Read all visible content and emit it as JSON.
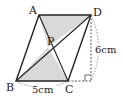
{
  "diagram": {
    "type": "parallelogram-geometry",
    "shape": "parallelogram ABCD with diagonals AC and BD intersecting at P",
    "points": {
      "A": {
        "x": 39,
        "y": 15,
        "label": "A"
      },
      "B": {
        "x": 16,
        "y": 81,
        "label": "B"
      },
      "C": {
        "x": 68,
        "y": 81,
        "label": "C"
      },
      "D": {
        "x": 91,
        "y": 15,
        "label": "D"
      },
      "P": {
        "x": 48,
        "y": 47,
        "label": "P"
      }
    },
    "shaded_regions": [
      "triangle APD",
      "triangle BPC"
    ],
    "dimensions": {
      "base": {
        "label": "5cm",
        "from": "B",
        "to": "C"
      },
      "height": {
        "label": "6cm",
        "from": "D",
        "to": "foot"
      }
    },
    "colors": {
      "stroke": "#222222",
      "shade": "#d9d9d9",
      "dashed": "#444444"
    }
  }
}
